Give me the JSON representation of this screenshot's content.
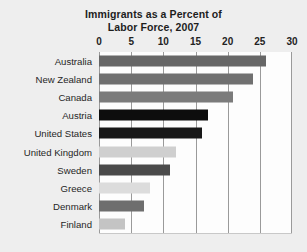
{
  "chart_data": {
    "type": "bar",
    "orientation": "horizontal",
    "title": "Immigrants as a Percent of Labor Force, 2007",
    "title_lines": [
      "Immigrants as a Percent of",
      "Labor Force, 2007"
    ],
    "xlabel": "",
    "ylabel": "",
    "xlim": [
      0,
      30
    ],
    "xticks": [
      0,
      5,
      10,
      15,
      20,
      25,
      30
    ],
    "xtick_labels": [
      "0",
      "5",
      "10",
      "15",
      "20",
      "25",
      "30"
    ],
    "grid": true,
    "grid_axis": "x",
    "legend": false,
    "categories": [
      "Australia",
      "New Zealand",
      "Canada",
      "Austria",
      "United States",
      "United Kingdom",
      "Sweden",
      "Greece",
      "Denmark",
      "Finland"
    ],
    "values": [
      25.9,
      24.0,
      20.9,
      16.9,
      16.0,
      12.0,
      11.0,
      8.0,
      7.0,
      4.0
    ],
    "bar_colors": [
      "#676767",
      "#707070",
      "#7b7b7b",
      "#0d0d0d",
      "#181818",
      "#cfcfcf",
      "#4a4a4a",
      "#dcdcdc",
      "#6e6e6e",
      "#c4c4c4"
    ],
    "background_color": "#eeeeee",
    "plot_background_color": "#fdfdfd",
    "gridline_color": "#9a9a9a",
    "text_color": "#232323"
  }
}
